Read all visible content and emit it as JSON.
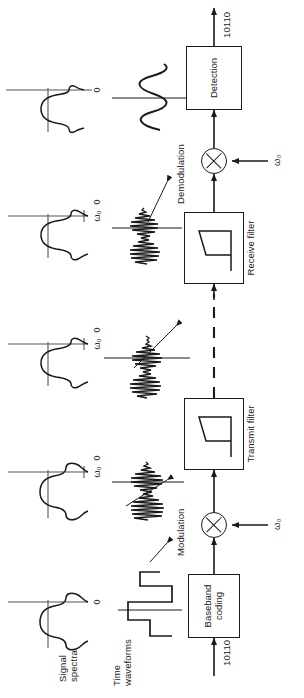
{
  "figure": {
    "orientation": "rotated-90-ccw",
    "row_labels": {
      "spectra": "Signal\nspectra",
      "waveforms": "Time\nwaveforms"
    },
    "blocks": [
      {
        "id": "baseband-coding",
        "label": "Baseband\ncoding",
        "kind": "box"
      },
      {
        "id": "modulation-mixer",
        "label": "Modulation",
        "kind": "mixer",
        "lo_label": "ω₀"
      },
      {
        "id": "transmit-filter",
        "label": "Transmit\nfilter",
        "kind": "filter"
      },
      {
        "id": "receive-filter",
        "label": "Receive\nfilter",
        "kind": "filter"
      },
      {
        "id": "demodulation-mixer",
        "label": "Demodulation",
        "kind": "mixer",
        "lo_label": "ω₀"
      },
      {
        "id": "detection",
        "label": "Detection",
        "kind": "box"
      }
    ],
    "signals": {
      "input_bits": "10110",
      "output_bits": "10110",
      "channel_label": ""
    },
    "spectra": [
      {
        "id": "spectrum-baseband",
        "center_tick": "0",
        "zero_tick": "",
        "shape": "sinc-wide",
        "center_label": "0"
      },
      {
        "id": "spectrum-modulated",
        "center_tick": "ω₀",
        "zero_tick": "0",
        "shape": "sinc-wide",
        "center_label": "ω₀"
      },
      {
        "id": "spectrum-transmit-filtered",
        "center_tick": "ω₀",
        "zero_tick": "0",
        "shape": "sinc-narrow",
        "center_label": "ω₀"
      },
      {
        "id": "spectrum-receive-filtered",
        "center_tick": "ω₀",
        "zero_tick": "0",
        "shape": "sinc-narrow",
        "center_label": "ω₀"
      },
      {
        "id": "spectrum-demodulated",
        "center_tick": "0",
        "zero_tick": "",
        "shape": "sinc-narrow",
        "center_label": "0"
      }
    ],
    "waveforms": [
      {
        "id": "waveform-baseband-nrz",
        "kind": "square-nrz"
      },
      {
        "id": "waveform-modulated",
        "kind": "modulated-carrier"
      },
      {
        "id": "waveform-transmit-filtered",
        "kind": "modulated-carrier"
      },
      {
        "id": "waveform-receive-filtered",
        "kind": "modulated-carrier"
      },
      {
        "id": "waveform-demodulated",
        "kind": "sine"
      }
    ],
    "colors": {
      "ink": "#1a1a1a",
      "background": "#ffffff"
    }
  }
}
